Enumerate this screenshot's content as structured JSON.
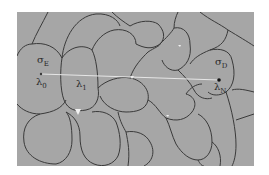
{
  "diagram": {
    "type": "grain-boundary cell structure",
    "background_color": "#a6a6a6",
    "boundary_color": "#3a3a3a",
    "path_line_color": "#e6e6e6",
    "labels": {
      "sigma_e": {
        "symbol": "σ",
        "subscript": "E"
      },
      "lambda_0": {
        "symbol": "λ",
        "subscript": "0"
      },
      "lambda_1": {
        "symbol": "λ",
        "subscript": "1"
      },
      "sigma_d": {
        "symbol": "σ",
        "subscript": "D"
      },
      "lambda_n": {
        "symbol": "λ",
        "subscript": "N"
      }
    },
    "points": [
      {
        "name": "lambda_0_point",
        "x": 41,
        "y": 74
      },
      {
        "name": "lambda_n_point",
        "x": 219,
        "y": 80
      }
    ]
  }
}
